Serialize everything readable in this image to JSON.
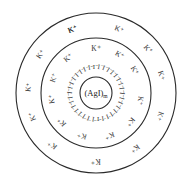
{
  "diagram": {
    "center": {
      "x": 96,
      "y": 93
    },
    "colors": {
      "stroke": "#2a2a2a",
      "text": "#333333",
      "background": "#ffffff"
    },
    "circles": [
      {
        "name": "outer-diffuse-layer-boundary",
        "r": 80
      },
      {
        "name": "adsorption-layer-boundary",
        "r": 55
      },
      {
        "name": "core-boundary",
        "r": 16
      }
    ],
    "core": {
      "label": "(AgI)",
      "subscript": "m"
    },
    "adsorbed_ion": {
      "label": "I⁻",
      "radius": 26,
      "count": 34
    },
    "inner_counter_ions": {
      "label": "K⁺",
      "radius": 45,
      "angles": [
        -90,
        -58,
        -30,
        10,
        40,
        72,
        108,
        140,
        172,
        200,
        232
      ]
    },
    "outer_counter_ions": {
      "label": "K⁺",
      "radius": 68,
      "angles": [
        -110,
        -70,
        -40,
        -15,
        20,
        55,
        90,
        130,
        160,
        185,
        215,
        250
      ]
    }
  }
}
